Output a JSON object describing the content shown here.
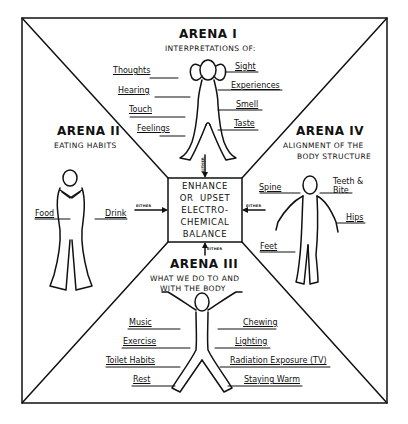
{
  "center": {
    "lines": [
      "ENHANCE",
      "OR  UPSET",
      "ELECTRO-",
      "CHEMICAL",
      "BALANCE"
    ]
  },
  "arrow_label": "EITHER",
  "arenas": {
    "arena1": {
      "title": "ARENA I",
      "subtitle": "INTERPRETATIONS OF:",
      "left_labels": [
        "Thoughts",
        "Hearing",
        "Touch",
        "Feelings"
      ],
      "right_labels": [
        "Sight",
        "Experiences",
        "Smell",
        "Taste"
      ]
    },
    "arena2": {
      "title": "ARENA II",
      "subtitle": "EATING HABITS",
      "left_labels": [
        "Food"
      ],
      "right_labels": [
        "Drink"
      ]
    },
    "arena3": {
      "title": "ARENA III",
      "subtitle_lines": [
        "WHAT WE DO TO AND",
        "WITH THE BODY"
      ],
      "left_labels": [
        "Music",
        "Exercise",
        "Toilet Habits",
        "Rest"
      ],
      "right_labels": [
        "Chewing",
        "Lighting",
        "Radiation Exposure (TV)",
        "Staying Warm"
      ]
    },
    "arena4": {
      "title": "ARENA IV",
      "subtitle_lines": [
        "ALIGNMENT OF THE",
        "BODY STRUCTURE"
      ],
      "left_labels": [
        "Spine",
        "Feet"
      ],
      "right_labels": [
        "Teeth & Bite",
        "Hips"
      ]
    }
  },
  "colors": {
    "ink": "#111111",
    "paper": "#ffffff"
  }
}
